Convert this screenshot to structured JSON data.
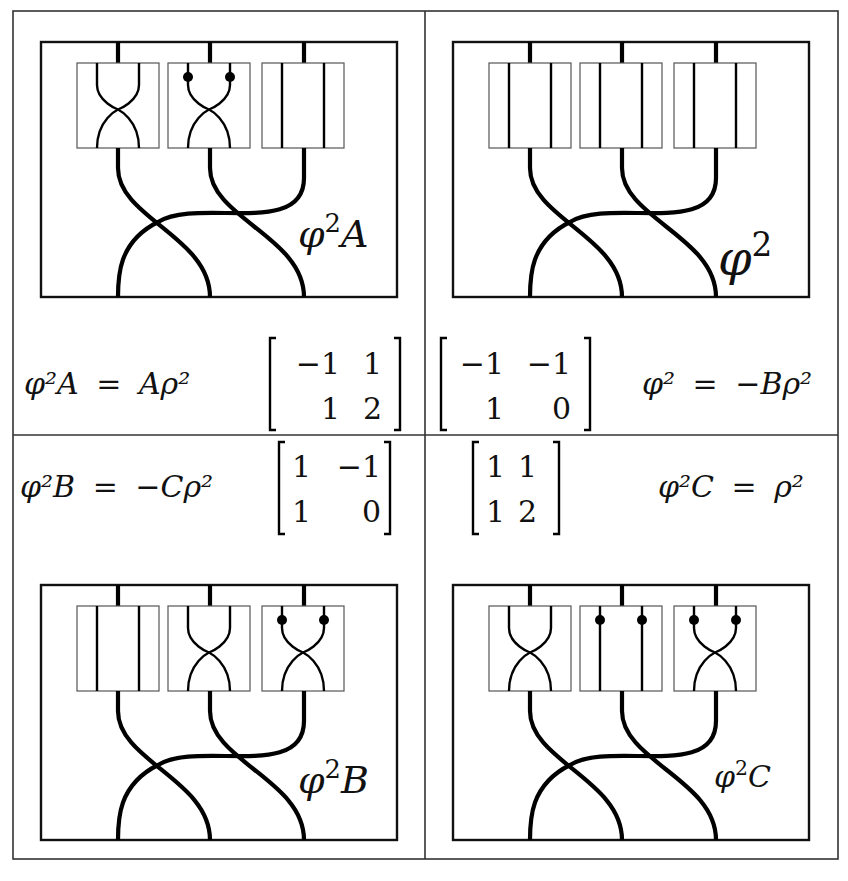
{
  "figure": {
    "panels": [
      {
        "id": "phi2A",
        "label_base": "φ",
        "label_sup": "2",
        "label_suffix": "A",
        "boxes": [
          "cross",
          "cross-dots",
          "straight"
        ]
      },
      {
        "id": "phi2",
        "label_base": "φ",
        "label_sup": "2",
        "label_suffix": "",
        "boxes": [
          "straight",
          "straight",
          "straight"
        ]
      },
      {
        "id": "phi2B",
        "label_base": "φ",
        "label_sup": "2",
        "label_suffix": "B",
        "boxes": [
          "straight",
          "cross",
          "cross-dots"
        ]
      },
      {
        "id": "phi2C",
        "label_base": "φ",
        "label_sup": "2",
        "label_suffix": "C",
        "boxes": [
          "cross",
          "straight-dots",
          "cross-dots"
        ]
      }
    ],
    "equations": {
      "phi2A": {
        "lhs": "φ²A",
        "eq": "=",
        "rhs": "Aρ²"
      },
      "phi2": {
        "lhs": "φ²",
        "eq": "=",
        "rhs": "−Bρ²"
      },
      "phi2B": {
        "lhs": "φ²B",
        "eq": "=",
        "rhs": "−Cρ²"
      },
      "phi2C": {
        "lhs": "φ²C",
        "eq": "=",
        "rhs": "ρ²"
      }
    },
    "matrices": {
      "phi2A": [
        [
          "−1",
          "1"
        ],
        [
          "1",
          "2"
        ]
      ],
      "phi2": [
        [
          "−1",
          "−1"
        ],
        [
          "1",
          "0"
        ]
      ],
      "phi2B": [
        [
          "1",
          "−1"
        ],
        [
          "1",
          "0"
        ]
      ],
      "phi2C": [
        [
          "1",
          "1"
        ],
        [
          "1",
          "2"
        ]
      ]
    }
  }
}
